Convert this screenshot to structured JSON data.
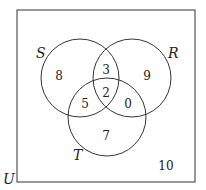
{
  "diagram": {
    "type": "venn",
    "universe_label": "U",
    "sets": [
      {
        "label": "S"
      },
      {
        "label": "R"
      },
      {
        "label": "T"
      }
    ],
    "regions": {
      "S_only": "8",
      "R_only": "9",
      "T_only": "7",
      "S_R_only": "3",
      "S_T_only": "5",
      "R_T_only": "0",
      "S_R_T": "2",
      "outside": "10"
    }
  }
}
